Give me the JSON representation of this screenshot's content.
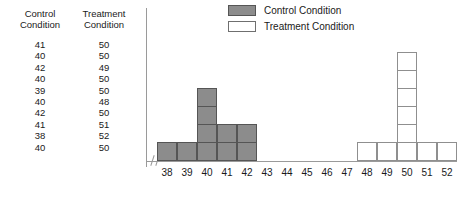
{
  "table": {
    "headers": [
      "Control\nCondition",
      "Treatment\nCondition"
    ],
    "rows": [
      [
        "41",
        "50"
      ],
      [
        "40",
        "50"
      ],
      [
        "42",
        "49"
      ],
      [
        "40",
        "50"
      ],
      [
        "39",
        "50"
      ],
      [
        "40",
        "48"
      ],
      [
        "42",
        "50"
      ],
      [
        "41",
        "51"
      ],
      [
        "38",
        "52"
      ],
      [
        "40",
        "50"
      ]
    ]
  },
  "legend": {
    "items": [
      {
        "label": "Control Condition",
        "swatch": "control",
        "color": "#8c8c8c"
      },
      {
        "label": "Treatment Condition",
        "swatch": "treatment",
        "color": "#ffffff"
      }
    ]
  },
  "chart_data": {
    "type": "bar",
    "title": "",
    "xlabel": "",
    "ylabel": "",
    "grid": false,
    "legend_position": "top-right",
    "axis_break": true,
    "categories": [
      "38",
      "39",
      "40",
      "41",
      "42",
      "43",
      "44",
      "45",
      "46",
      "47",
      "48",
      "49",
      "50",
      "51",
      "52"
    ],
    "xlim": [
      38,
      52
    ],
    "ylim": [
      0,
      6
    ],
    "series": [
      {
        "name": "Control Condition",
        "color": "#8c8c8c",
        "values": [
          1,
          1,
          4,
          2,
          2,
          0,
          0,
          0,
          0,
          0,
          0,
          0,
          0,
          0,
          0
        ]
      },
      {
        "name": "Treatment Condition",
        "color": "#ffffff",
        "values": [
          0,
          0,
          0,
          0,
          0,
          0,
          0,
          0,
          0,
          0,
          1,
          1,
          6,
          1,
          1
        ]
      }
    ]
  }
}
